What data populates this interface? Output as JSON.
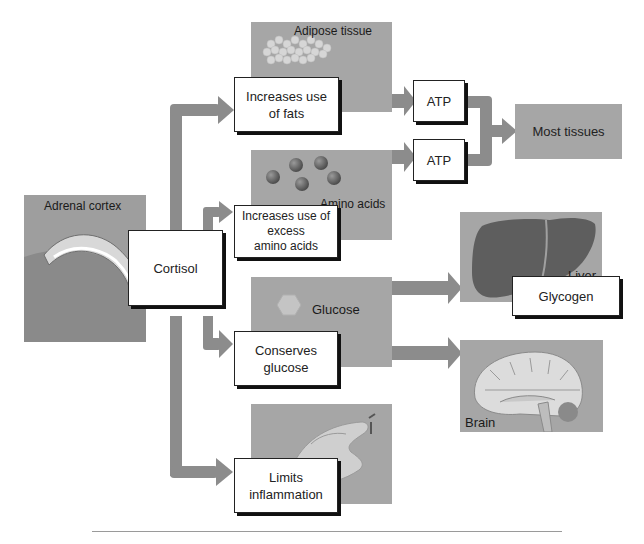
{
  "diagram": {
    "source": {
      "panel_label": "Adrenal cortex",
      "hormone": "Cortisol"
    },
    "effects": [
      {
        "id": "fats",
        "label": "Increases use of fats",
        "panel_label": "Adipose tissue",
        "output": "ATP"
      },
      {
        "id": "amino",
        "label": "Increases use of excess amino acids",
        "panel_label": "Amino acids",
        "output": "ATP"
      },
      {
        "id": "glucose",
        "label": "Conserves glucose",
        "panel_label": "Glucose",
        "targets": [
          "Liver",
          "Brain"
        ]
      },
      {
        "id": "inflammation",
        "label": "Limits inflammation"
      }
    ],
    "destinations": {
      "atp_target": "Most tissues",
      "liver": {
        "panel_label": "Liver",
        "product": "Glycogen"
      },
      "brain": {
        "panel_label": "Brain"
      }
    },
    "box_texts": {
      "fats_line1": "Increases use",
      "fats_line2": "of fats",
      "amino_line1": "Increases use of",
      "amino_line2": "excess",
      "amino_line3": "amino acids",
      "glucose_line1": "Conserves",
      "glucose_line2": "glucose",
      "inflam_line1": "Limits",
      "inflam_line2": "inflammation",
      "atp1": "ATP",
      "atp2": "ATP",
      "most_tissues": "Most tissues",
      "glycogen": "Glycogen",
      "cortisol": "Cortisol"
    },
    "colors": {
      "panel": "#a6a6a6",
      "arrow": "#8c8c8c",
      "box_border": "#222222"
    }
  }
}
